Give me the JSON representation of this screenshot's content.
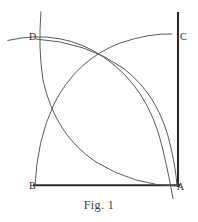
{
  "figure": {
    "caption": "Fig. 1",
    "labels": {
      "A": "A",
      "B": "B",
      "C": "C",
      "D": "D"
    },
    "colors": {
      "stroke_heavy": "#2b2b2b",
      "stroke_arc": "#5a5a5a",
      "background": "#ffffff",
      "text": "#2a2a2a"
    },
    "geometry": {
      "square": {
        "A": [
          178,
          185
        ],
        "B": [
          35,
          185
        ],
        "C": [
          178,
          38
        ],
        "D": [
          35,
          38
        ]
      },
      "heavy_edges": [
        "right-side-AC",
        "bottom-side-AB"
      ],
      "arc_radius": 143,
      "arcs": [
        {
          "name": "arc-centered-A",
          "from": "D",
          "to": "B-side",
          "center": "A"
        },
        {
          "name": "arc-centered-B",
          "from": "C",
          "to": "A-side",
          "center": "B"
        },
        {
          "name": "arc-centered-C",
          "from": "B",
          "to": "D-side",
          "center": "C"
        },
        {
          "name": "arc-centered-D",
          "from": "A",
          "to": "C-side",
          "center": "D"
        }
      ],
      "intersections": [
        [
          105,
          58
        ],
        [
          105,
          163
        ],
        [
          62,
          112
        ],
        [
          150,
          112
        ]
      ]
    }
  }
}
